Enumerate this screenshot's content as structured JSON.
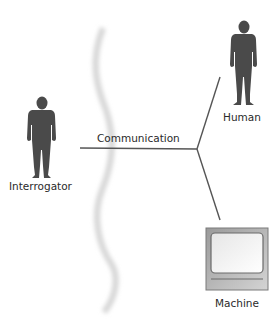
{
  "diagram": {
    "nodes": {
      "interrogator": {
        "label": "Interrogator",
        "icon": "person-icon"
      },
      "human": {
        "label": "Human",
        "icon": "person-icon"
      },
      "machine": {
        "label": "Machine",
        "icon": "computer-monitor-icon"
      }
    },
    "edges": {
      "communication": {
        "label": "Communication"
      }
    },
    "colors": {
      "silhouette": "#4a4a4a",
      "line": "#555555",
      "divider": "#d8d8d8",
      "monitor_frame": "#b9b9b9"
    }
  }
}
